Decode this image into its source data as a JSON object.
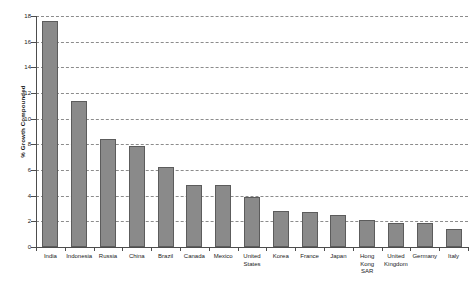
{
  "chart_data": {
    "type": "bar",
    "title": "",
    "xlabel": "",
    "ylabel": "% Growth Compounded",
    "ylim": [
      0,
      18
    ],
    "ytick_labels": [
      "18",
      "16",
      "14",
      "12",
      "10",
      "8",
      "6",
      "4",
      "2",
      "0"
    ],
    "yticks": [
      18,
      16,
      14,
      12,
      10,
      8,
      6,
      4,
      2,
      0
    ],
    "grid": true,
    "legend": null,
    "bar_color": "#8a8a8a",
    "bar_edge_color": "#5c5c5c",
    "axis_color": "#4d4d4d",
    "gridline_color": "#8c8c8c",
    "categories": [
      "India",
      "Indonesia",
      "Russia",
      "China",
      "Brazil",
      "Canada",
      "Mexico",
      "United States",
      "Korea",
      "France",
      "Japan",
      "Hong Kong SAR",
      "United Kingdom",
      "Germany",
      "Italy"
    ],
    "values": [
      17.6,
      11.4,
      8.4,
      7.9,
      6.2,
      4.8,
      4.8,
      3.9,
      2.8,
      2.75,
      2.5,
      2.1,
      1.9,
      1.9,
      1.4
    ]
  }
}
